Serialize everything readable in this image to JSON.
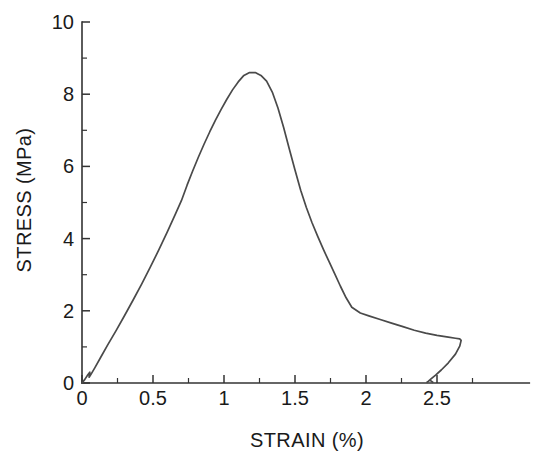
{
  "chart_data": {
    "type": "line",
    "title": "",
    "xlabel": "STRAIN (%)",
    "ylabel": "STRESS (MPa)",
    "xlim": [
      0,
      3.15
    ],
    "ylim": [
      0,
      10
    ],
    "grid": false,
    "legend": null,
    "x_ticks_major": [
      "0",
      "0.5",
      "1",
      "1.5",
      "2",
      "2.5"
    ],
    "x_ticks_major_values": [
      0,
      0.5,
      1,
      1.5,
      2,
      2.5
    ],
    "x_ticks_minor_values": [
      0.25,
      0.75,
      1.25,
      1.75,
      2.25,
      2.75
    ],
    "y_ticks_major": [
      "0",
      "2",
      "4",
      "6",
      "8",
      "10"
    ],
    "y_ticks_major_values": [
      0,
      2,
      4,
      6,
      8,
      10
    ],
    "y_ticks_minor_values": [
      1,
      3,
      5,
      7,
      9
    ],
    "series": [
      {
        "name": "stress-strain",
        "color": "#4a4a4a",
        "x": [
          0.0,
          0.02,
          0.04,
          0.055,
          0.05,
          0.06,
          0.09,
          0.13,
          0.18,
          0.24,
          0.3,
          0.36,
          0.42,
          0.48,
          0.54,
          0.6,
          0.66,
          0.7,
          0.74,
          0.78,
          0.82,
          0.86,
          0.9,
          0.94,
          0.98,
          1.02,
          1.06,
          1.1,
          1.14,
          1.18,
          1.22,
          1.26,
          1.3,
          1.34,
          1.38,
          1.42,
          1.46,
          1.5,
          1.54,
          1.58,
          1.62,
          1.66,
          1.7,
          1.74,
          1.78,
          1.82,
          1.86,
          1.9,
          1.96,
          2.02,
          2.1,
          2.18,
          2.26,
          2.34,
          2.42,
          2.5,
          2.58,
          2.63,
          2.66,
          2.67,
          2.66,
          2.63,
          2.58,
          2.53,
          2.49,
          2.46,
          2.44,
          2.43,
          2.45,
          2.47
        ],
        "y": [
          0.0,
          0.1,
          0.22,
          0.3,
          0.16,
          0.22,
          0.42,
          0.7,
          1.05,
          1.45,
          1.87,
          2.3,
          2.74,
          3.2,
          3.68,
          4.18,
          4.7,
          5.05,
          5.48,
          5.88,
          6.26,
          6.62,
          6.96,
          7.28,
          7.58,
          7.86,
          8.12,
          8.34,
          8.52,
          8.6,
          8.6,
          8.52,
          8.36,
          8.06,
          7.62,
          7.08,
          6.48,
          5.9,
          5.34,
          4.86,
          4.44,
          4.06,
          3.7,
          3.36,
          3.02,
          2.68,
          2.36,
          2.1,
          1.94,
          1.86,
          1.76,
          1.66,
          1.56,
          1.46,
          1.38,
          1.32,
          1.27,
          1.24,
          1.22,
          1.18,
          1.02,
          0.8,
          0.56,
          0.36,
          0.22,
          0.12,
          0.05,
          0.02,
          0.08,
          0.02
        ]
      }
    ]
  },
  "axes": {
    "x_title": "STRAIN (%)",
    "y_title": "STRESS (MPa)"
  }
}
